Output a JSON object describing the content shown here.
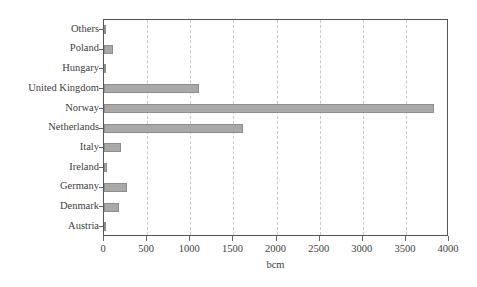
{
  "chart_data": {
    "type": "bar",
    "orientation": "horizontal",
    "title": "",
    "xlabel": "bcm",
    "ylabel": "",
    "xlim": [
      0,
      4000
    ],
    "ylim": [
      0,
      11
    ],
    "grid": true,
    "grid_axis": "x",
    "legend": false,
    "bar_color": "#a9a9a9",
    "bar_edge_color": "#8d8d8d",
    "frame_color": "#555555",
    "gridline_color": "#c9c9c9",
    "xticks": [
      0,
      500,
      1000,
      1500,
      2000,
      2500,
      3000,
      3500,
      4000
    ],
    "xtick_labels": [
      "0",
      "500",
      "1000",
      "1500",
      "2000",
      "2500",
      "3000",
      "3500",
      "4000"
    ],
    "categories": [
      "Austria",
      "Denmark",
      "Germany",
      "Ireland",
      "Italy",
      "Netherlands",
      "Norway",
      "United Kingdom",
      "Hungary",
      "Poland",
      "Others"
    ],
    "values": [
      10,
      175,
      270,
      40,
      200,
      1610,
      3830,
      1100,
      25,
      110,
      20
    ],
    "bars": [
      {
        "label": "Austria",
        "value": 10
      },
      {
        "label": "Denmark",
        "value": 175
      },
      {
        "label": "Germany",
        "value": 270
      },
      {
        "label": "Ireland",
        "value": 40
      },
      {
        "label": "Italy",
        "value": 200
      },
      {
        "label": "Netherlands",
        "value": 1610
      },
      {
        "label": "Norway",
        "value": 3830
      },
      {
        "label": "United Kingdom",
        "value": 1100
      },
      {
        "label": "Hungary",
        "value": 25
      },
      {
        "label": "Poland",
        "value": 110
      },
      {
        "label": "Others",
        "value": 20
      }
    ]
  }
}
